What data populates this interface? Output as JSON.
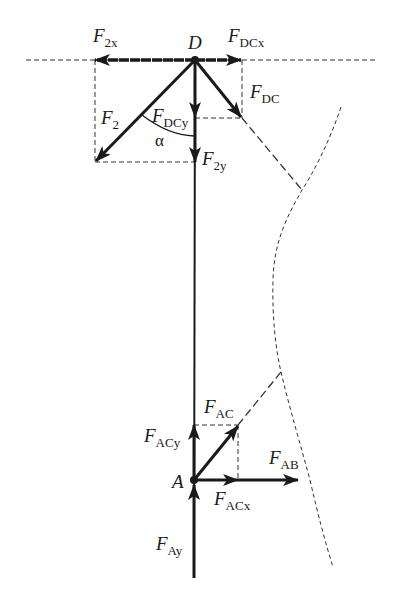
{
  "diagram": {
    "type": "free-body force diagram",
    "colors": {
      "ink": "#1a1a1a",
      "dashed": "#333333",
      "background": "#ffffff"
    },
    "nodes": {
      "D": {
        "label": "D",
        "x": 195,
        "y": 60
      },
      "A": {
        "label": "A",
        "x": 194,
        "y": 480
      }
    },
    "labels": {
      "F2x": {
        "main": "F",
        "sub": "2x"
      },
      "FDCx": {
        "main": "F",
        "sub": "DCx"
      },
      "FDC": {
        "main": "F",
        "sub": "DC"
      },
      "F2": {
        "main": "F",
        "sub": "2"
      },
      "FDCy": {
        "main": "F",
        "sub": "DCy"
      },
      "alpha": "α",
      "F2y": {
        "main": "F",
        "sub": "2y"
      },
      "FAC": {
        "main": "F",
        "sub": "AC"
      },
      "FACy": {
        "main": "F",
        "sub": "ACy"
      },
      "FAB": {
        "main": "F",
        "sub": "AB"
      },
      "FACx": {
        "main": "F",
        "sub": "ACx"
      },
      "FAy": {
        "main": "F",
        "sub": "Ay"
      }
    },
    "forces_at_D": [
      "F2x (left)",
      "FDCx (right)",
      "F2 (down-left)",
      "FDC (down-right)",
      "FDCy (down)",
      "F2y (down)"
    ],
    "forces_at_A": [
      "FACy (up)",
      "FAC (up-right)",
      "FACx (right)",
      "FAB (right)",
      "FAy (up)"
    ],
    "angle": {
      "label": "α",
      "between": "F2 and vertical"
    }
  }
}
